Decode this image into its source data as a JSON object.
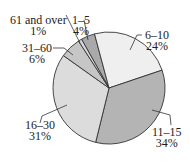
{
  "chart_data": {
    "type": "pie",
    "title": "",
    "start_angle_deg": -29.4,
    "direction": "clockwise",
    "slices": [
      {
        "label": "1–5",
        "value": 4,
        "pct": "4%",
        "color": "#a9a9a9"
      },
      {
        "label": "6–10",
        "value": 24,
        "pct": "24%",
        "color": "#efefef"
      },
      {
        "label": "11–15",
        "value": 34,
        "pct": "34%",
        "color": "#b4b4b4"
      },
      {
        "label": "16–30",
        "value": 31,
        "pct": "31%",
        "color": "#dcdcdc"
      },
      {
        "label": "31–60",
        "value": 6,
        "pct": "6%",
        "color": "#c6c6c6"
      },
      {
        "label": "61 and over",
        "value": 1,
        "pct": "1%",
        "color": "#d8d8d8"
      }
    ]
  },
  "labels": {
    "s0": {
      "name": "1–5",
      "pct": "4%"
    },
    "s1": {
      "name": "6–10",
      "pct": "24%"
    },
    "s2": {
      "name": "11–15",
      "pct": "34%"
    },
    "s3": {
      "name": "16–30",
      "pct": "31%"
    },
    "s4": {
      "name": "31–60",
      "pct": "6%"
    },
    "s5": {
      "name": "61 and over",
      "pct": "1%"
    }
  }
}
